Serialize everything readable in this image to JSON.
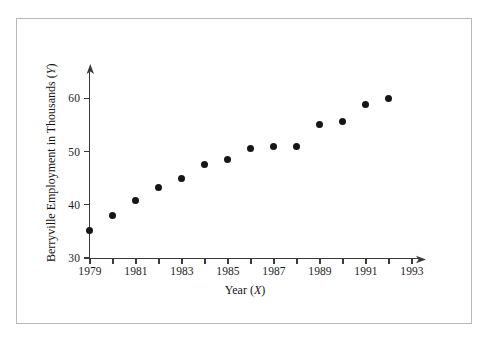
{
  "figure": {
    "x_axis_title_prefix": "Year (",
    "x_axis_title_var": "X",
    "x_axis_title_suffix": ")",
    "y_axis_title_prefix": "Berryville Employment in Thousands (",
    "y_axis_title_var": "Y",
    "y_axis_title_suffix": ")",
    "frame_color": "#b9b9b9",
    "axis_color": "#3a3a3a",
    "point_color": "#161616"
  },
  "chart_data": {
    "type": "scatter",
    "title": "",
    "xlabel": "Year (X)",
    "ylabel": "Berryville Employment in Thousands (Y)",
    "x": [
      1979,
      1980,
      1981,
      1982,
      1983,
      1984,
      1985,
      1986,
      1987,
      1988,
      1989,
      1990,
      1991,
      1992
    ],
    "values": [
      35.2,
      38.0,
      40.8,
      43.2,
      45.0,
      47.5,
      48.5,
      50.5,
      51.0,
      51.0,
      55.0,
      55.6,
      58.7,
      60.0
    ],
    "xlim": [
      1979,
      1994
    ],
    "ylim": [
      30,
      63
    ],
    "x_major_ticks": [
      1979,
      1981,
      1983,
      1985,
      1987,
      1989,
      1991,
      1993
    ],
    "x_minor_ticks": [
      1980,
      1982,
      1984,
      1986,
      1988,
      1990,
      1992
    ],
    "x_tick_labels": [
      "1979",
      "1981",
      "1983",
      "1985",
      "1987",
      "1989",
      "1991",
      "1993"
    ],
    "y_ticks": [
      30,
      40,
      50,
      60
    ],
    "y_tick_labels": [
      "30",
      "40",
      "50",
      "60"
    ],
    "grid": false,
    "legend": null
  }
}
